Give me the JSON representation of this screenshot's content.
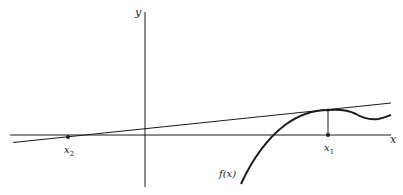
{
  "diagram": {
    "type": "newton-method-illustration",
    "axes": {
      "x_label": "x",
      "y_label": "y"
    },
    "curve": {
      "label": "f(x)"
    },
    "points": [
      {
        "id": "x1",
        "label_base": "x",
        "label_sub": "1",
        "description": "point of tangency projected to x-axis"
      },
      {
        "id": "x2",
        "label_base": "x",
        "label_sub": "2",
        "description": "tangent line's x-intercept"
      }
    ],
    "colors": {
      "ink": "#1a1a1a",
      "background": "#ffffff"
    }
  }
}
